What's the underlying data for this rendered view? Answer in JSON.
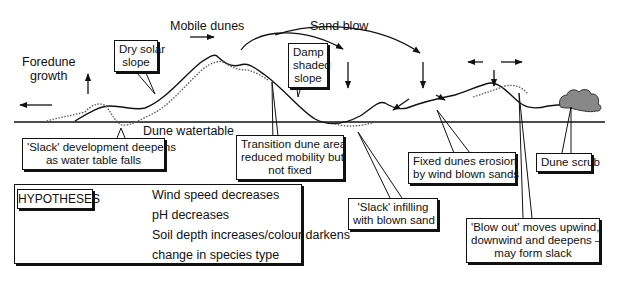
{
  "diagram": {
    "type": "cross-section"
  },
  "labels": {
    "foredune_growth": [
      "Foredune",
      "growth"
    ],
    "mobile_dunes": "Mobile dunes",
    "sand_blow": "Sand blow",
    "dune_watertable": "Dune watertable"
  },
  "callouts": {
    "dry_solar_slope": [
      "Dry solar",
      "slope"
    ],
    "damp_shaded_slope": [
      "Damp",
      "shaded",
      "slope"
    ],
    "slack_development": [
      "'Slack' development deepens",
      "as water table falls"
    ],
    "transition_dune": [
      "Transition dune area",
      "reduced mobility but",
      "not fixed"
    ],
    "slack_infilling": [
      "'Slack' infilling",
      "with blown sand"
    ],
    "fixed_dunes_erosion": [
      "Fixed dunes erosion",
      "by wind blown sands"
    ],
    "dune_scrub": [
      "Dune scrub"
    ],
    "blow_out": [
      "'Blow out' moves upwind,",
      "downwind and deepens –",
      "may form slack"
    ]
  },
  "hypotheses": {
    "title": "HYPOTHESES",
    "items": [
      "Wind speed decreases",
      "pH decreases",
      "Soil depth increases/colour darkens",
      "change in species type"
    ]
  }
}
